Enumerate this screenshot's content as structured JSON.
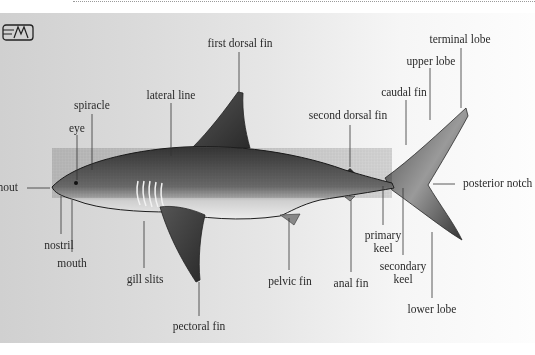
{
  "diagram": {
    "logo_icon": "book-logo-icon",
    "labels": {
      "first_dorsal_fin": "first dorsal fin",
      "terminal_lobe": "terminal lobe",
      "upper_lobe": "upper lobe",
      "caudal_fin": "caudal fin",
      "second_dorsal_fin": "second dorsal fin",
      "lateral_line": "lateral line",
      "spiracle": "spiracle",
      "eye": "eye",
      "snout": "snout",
      "nostril": "nostril",
      "mouth": "mouth",
      "gill_slits": "gill slits",
      "pectoral_fin": "pectoral fin",
      "pelvic_fin": "pelvic fin",
      "anal_fin": "anal fin",
      "primary_keel_1": "primary",
      "primary_keel_2": "keel",
      "secondary_keel_1": "secondary",
      "secondary_keel_2": "keel",
      "lower_lobe": "lower lobe",
      "posterior_notch": "posterior notch"
    },
    "colors": {
      "background_left": "#d0d0d0",
      "background_right": "#fdfdfd",
      "shark_dark": "#3a3a3a",
      "shark_belly": "#e8e8e8",
      "leader_line": "#333333"
    }
  }
}
